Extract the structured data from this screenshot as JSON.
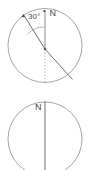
{
  "diagram": {
    "stroke_color": "#8c8c8c",
    "axis_color": "#555555",
    "text_color": "#4a4a4a",
    "top_figure": {
      "name": "tilted-axis-circle",
      "circle": {
        "cx": 45,
        "cy": 45.5,
        "r": 37
      },
      "center_dot": {
        "cx": 45,
        "cy": 49,
        "r": 1.2
      },
      "north_label": "N",
      "north_label_pos": {
        "x": 50,
        "y": 13
      },
      "angle_label": "30°",
      "angle_label_pos": {
        "x": 31,
        "y": 17
      },
      "angle_value": 30,
      "angle_unit": "degrees",
      "vertical_reference": {
        "x1": 45,
        "y1": 49,
        "x2": 45,
        "y2": 83,
        "style": "dashed"
      },
      "vertical_arrow": {
        "x1": 45,
        "y1": 49,
        "x2": 45,
        "y2": 10
      },
      "tilted_axis": {
        "x1": 23.5,
        "y1": 14.5,
        "x2": 72,
        "y2": 79
      },
      "arc": {
        "cx": 45,
        "cy": 49,
        "r": 22,
        "from_deg": 90,
        "to_deg": 117
      }
    },
    "bottom_figure": {
      "name": "vertical-axis-circle",
      "circle": {
        "cx": 45,
        "cy": 139,
        "r": 37
      },
      "north_label": "N",
      "north_label_pos": {
        "x": 38,
        "y": 107
      },
      "axis_line": {
        "x1": 45,
        "y1": 101,
        "x2": 45,
        "y2": 170
      }
    }
  }
}
